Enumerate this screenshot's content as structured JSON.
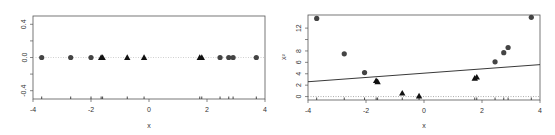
{
  "figure": {
    "panels": [
      {
        "id": "left",
        "xlabel": "x",
        "ylabel": "",
        "x_ticks": [
          "-4",
          "-2",
          "0",
          "2",
          "4"
        ],
        "y_ticks": [
          "-0.4",
          "0.0",
          "0.4"
        ]
      },
      {
        "id": "right",
        "xlabel": "x",
        "ylabel": "x²",
        "x_ticks": [
          "-4",
          "-2",
          "0",
          "2",
          "4"
        ],
        "y_ticks": [
          "0",
          "2",
          "4",
          "6",
          "8",
          "12"
        ]
      }
    ]
  },
  "chart_data": [
    {
      "type": "scatter",
      "title": "",
      "xlabel": "x",
      "ylabel": "",
      "xlim": [
        -4,
        4
      ],
      "ylim": [
        -0.5,
        0.5
      ],
      "x_ticks": [
        -4,
        -2,
        0,
        2,
        4
      ],
      "y_ticks": [
        -0.4,
        0.0,
        0.4
      ],
      "grid": false,
      "reference_lines": [
        {
          "type": "horizontal",
          "y": 0.0,
          "style": "dotted",
          "color": "#bbbbbb"
        }
      ],
      "rug": true,
      "series": [
        {
          "name": "class-circle",
          "marker": "circle",
          "color": "#444444",
          "points": [
            [
              -3.7,
              0.0
            ],
            [
              -2.7,
              0.0
            ],
            [
              -2.0,
              0.0
            ],
            [
              2.45,
              0.0
            ],
            [
              2.75,
              0.0
            ],
            [
              2.9,
              0.0
            ],
            [
              3.7,
              0.0
            ]
          ]
        },
        {
          "name": "class-triangle",
          "marker": "triangle",
          "color": "#111111",
          "points": [
            [
              -1.65,
              0.0
            ],
            [
              -1.6,
              0.0
            ],
            [
              -0.75,
              0.0
            ],
            [
              -0.17,
              0.0
            ],
            [
              1.75,
              0.0
            ],
            [
              1.82,
              0.0
            ]
          ]
        }
      ]
    },
    {
      "type": "scatter",
      "title": "",
      "xlabel": "x",
      "ylabel": "x²",
      "xlim": [
        -4,
        4
      ],
      "ylim": [
        -0.6,
        14.3
      ],
      "x_ticks": [
        -4,
        -2,
        0,
        2,
        4
      ],
      "y_ticks": [
        0,
        2,
        4,
        6,
        8,
        12
      ],
      "grid": false,
      "reference_lines": [
        {
          "type": "horizontal",
          "y": 0.0,
          "style": "dotted",
          "color": "#888888"
        }
      ],
      "rug": true,
      "series": [
        {
          "name": "class-circle",
          "marker": "circle",
          "color": "#444444",
          "points": [
            [
              -3.7,
              13.7
            ],
            [
              -2.75,
              7.5
            ],
            [
              -2.05,
              4.2
            ],
            [
              2.45,
              6.1
            ],
            [
              2.75,
              7.7
            ],
            [
              2.9,
              8.6
            ],
            [
              3.7,
              13.9
            ]
          ]
        },
        {
          "name": "class-triangle",
          "marker": "triangle",
          "color": "#111111",
          "points": [
            [
              -1.65,
              2.8
            ],
            [
              -1.6,
              2.6
            ],
            [
              -0.75,
              0.6
            ],
            [
              -0.17,
              0.1
            ],
            [
              1.75,
              3.2
            ],
            [
              1.82,
              3.4
            ]
          ]
        },
        {
          "name": "decision-line",
          "type": "line",
          "color": "#222222",
          "points": [
            [
              -4,
              2.6
            ],
            [
              4,
              5.6
            ]
          ]
        }
      ]
    }
  ]
}
